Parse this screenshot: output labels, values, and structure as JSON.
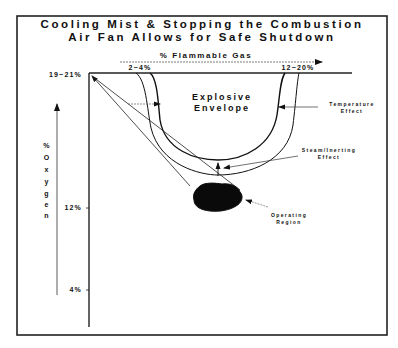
{
  "title": {
    "line1": "Cooling Mist & Stopping the Combustion",
    "line2": "Air Fan Allows for Safe Shutdown"
  },
  "x_axis": {
    "label": "% Flammable Gas",
    "lower_limit": "2~4%",
    "upper_limit": "12~20%"
  },
  "y_axis": {
    "label_chars": [
      "%",
      "O",
      "x",
      "y",
      "g",
      "e",
      "n"
    ],
    "label": "% Oxygen",
    "ticks": [
      "19~21%",
      "12%",
      "4%"
    ]
  },
  "regions": {
    "explosive_envelope_line1": "Explosive",
    "explosive_envelope_line2": "Envelope",
    "operating_region_line1": "Operating",
    "operating_region_line2": "Region"
  },
  "annotations": {
    "temperature_line1": "Temperature",
    "temperature_line2": "Effect",
    "steam_line1": "Steam/Inerting",
    "steam_line2": "Effect"
  },
  "colors": {
    "ink": "#111111",
    "background": "#ffffff"
  }
}
